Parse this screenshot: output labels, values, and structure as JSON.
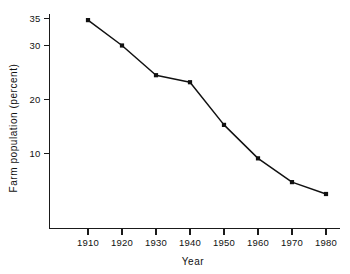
{
  "chart_data": {
    "type": "line",
    "title": "",
    "xlabel": "Year",
    "ylabel": "Farm population (percent)",
    "x": [
      1910,
      1920,
      1930,
      1940,
      1950,
      1960,
      1970,
      1980
    ],
    "values": [
      34.7,
      30.0,
      24.5,
      23.2,
      15.3,
      9.1,
      4.7,
      2.5
    ],
    "categories": [
      "1910",
      "1920",
      "1930",
      "1940",
      "1950",
      "1960",
      "1970",
      "1980"
    ],
    "series": [
      {
        "name": "Farm population (percent)",
        "values": [
          34.7,
          30.0,
          24.5,
          23.2,
          15.3,
          9.1,
          4.7,
          2.5
        ]
      }
    ],
    "xlim": [
      1905,
      1985
    ],
    "ylim": [
      0,
      36
    ],
    "xticks": [
      1910,
      1920,
      1930,
      1940,
      1950,
      1960,
      1970,
      1980
    ],
    "xtick_labels": [
      "1910",
      "1920",
      "1930",
      "1940",
      "1950",
      "1960",
      "1970",
      "1980"
    ],
    "yticks": [
      10,
      20,
      30,
      35
    ],
    "ytick_labels": [
      "10",
      "20",
      "30",
      "35"
    ],
    "grid": false,
    "legend": false,
    "legend_position": "none",
    "marker": "square",
    "line_color": "#111111",
    "marker_color": "#111111",
    "background_color": "#ffffff"
  },
  "axes": {
    "y_title": "Farm population (percent)",
    "x_title": "Year"
  },
  "ticks": {
    "y": [
      {
        "label": "35",
        "value": 35
      },
      {
        "label": "30",
        "value": 30
      },
      {
        "label": "20",
        "value": 20
      },
      {
        "label": "10",
        "value": 10
      }
    ],
    "x": [
      {
        "label": "1910",
        "value": 1910
      },
      {
        "label": "1920",
        "value": 1920
      },
      {
        "label": "1930",
        "value": 1930
      },
      {
        "label": "1940",
        "value": 1940
      },
      {
        "label": "1950",
        "value": 1950
      },
      {
        "label": "1960",
        "value": 1960
      },
      {
        "label": "1970",
        "value": 1970
      },
      {
        "label": "1980",
        "value": 1980
      }
    ]
  },
  "colors": {
    "ink": "#111111",
    "paper": "#ffffff"
  }
}
